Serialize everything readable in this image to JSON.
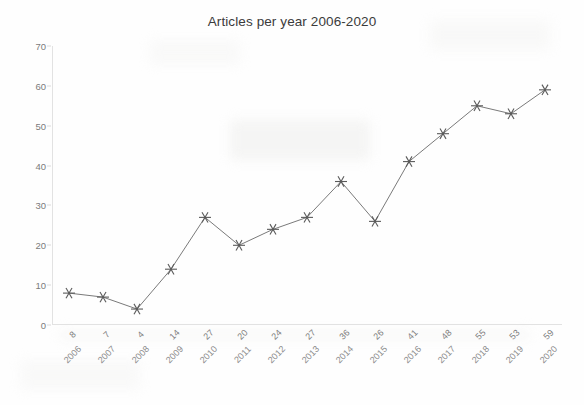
{
  "chart_data": {
    "type": "line",
    "title": "Articles per year 2006-2020",
    "xlabel": "",
    "ylabel": "",
    "categories": [
      "2006",
      "2007",
      "2008",
      "2009",
      "2010",
      "2011",
      "2012",
      "2013",
      "2014",
      "2015",
      "2016",
      "2017",
      "2018",
      "2019",
      "2020"
    ],
    "values": [
      8,
      7,
      4,
      14,
      27,
      20,
      24,
      27,
      36,
      26,
      41,
      48,
      55,
      53,
      59
    ],
    "point_value_labels": [
      "8",
      "7",
      "4",
      "14",
      "27",
      "20",
      "24",
      "27",
      "36",
      "26",
      "41",
      "48",
      "55",
      "53",
      "59"
    ],
    "ylim": [
      0,
      70
    ],
    "ytick_labels": [
      "0",
      "10",
      "20",
      "30",
      "40",
      "50",
      "60",
      "70"
    ],
    "ytick_values": [
      0,
      10,
      20,
      30,
      40,
      50,
      60,
      70
    ],
    "grid": false,
    "legend": false,
    "legend_position": "none",
    "marker": "asterisk-6-point",
    "line_color": "#7a7a7a",
    "marker_color": "#5a5a5a",
    "title_color": "#3b3b3b",
    "axis_color": "#e2e2e2",
    "tick_label_color": "#7b7b7b",
    "background_color": "#fefefe"
  }
}
